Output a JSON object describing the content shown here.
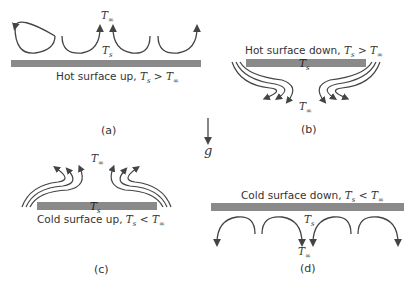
{
  "figure": {
    "gravity_label": "g",
    "panels": [
      {
        "id": "a",
        "label": "(a)",
        "caption_prefix": "Hot surface up, ",
        "ts": "T",
        "ts_sub": "s",
        "relation": " > ",
        "tinf": "T",
        "tinf_sub": "∞",
        "surface_label": "T",
        "surface_sub": "s",
        "ambient_label": "T",
        "ambient_sub": "∞"
      },
      {
        "id": "b",
        "label": "(b)",
        "caption_prefix": "Hot surface down, ",
        "ts": "T",
        "ts_sub": "s",
        "relation": " > ",
        "tinf": "T",
        "tinf_sub": "∞",
        "surface_label": "T",
        "surface_sub": "s",
        "ambient_label": "T",
        "ambient_sub": "∞"
      },
      {
        "id": "c",
        "label": "(c)",
        "caption_prefix": "Cold surface up, ",
        "ts": "T",
        "ts_sub": "s",
        "relation": " < ",
        "tinf": "T",
        "tinf_sub": "∞",
        "surface_label": "T",
        "surface_sub": "s",
        "ambient_label": "T",
        "ambient_sub": "∞"
      },
      {
        "id": "d",
        "label": "(d)",
        "caption_prefix": "Cold surface down, ",
        "ts": "T",
        "ts_sub": "s",
        "relation": " < ",
        "tinf": "T",
        "tinf_sub": "∞",
        "surface_label": "T",
        "surface_sub": "s",
        "ambient_label": "T",
        "ambient_sub": "∞"
      }
    ],
    "colors": {
      "plate": "#8a8a8a",
      "line": "#444444",
      "text": "#333333"
    }
  }
}
